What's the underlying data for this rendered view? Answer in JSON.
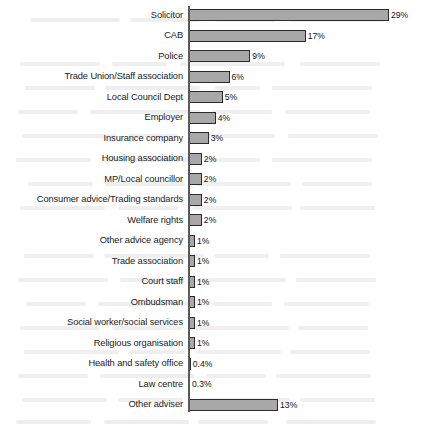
{
  "chart_data": {
    "type": "bar",
    "orientation": "horizontal",
    "title": "",
    "subtitle": "",
    "xlabel": "",
    "ylabel": "",
    "xlim": [
      0,
      30
    ],
    "grid": false,
    "legend": null,
    "value_suffix": "%",
    "categories": [
      "Solicitor",
      "CAB",
      "Police",
      "Trade Union/Staff association",
      "Local Council Dept",
      "Employer",
      "Insurance company",
      "Housing association",
      "MP/Local councillor",
      "Consumer advice/Trading standards",
      "Welfare rights",
      "Other advice agency",
      "Trade association",
      "Court staff",
      "Ombudsman",
      "Social worker/social services",
      "Religious organisation",
      "Health and safety office",
      "Law centre",
      "Other adviser"
    ],
    "values": [
      29,
      17,
      9,
      6,
      5,
      4,
      3,
      2,
      2,
      2,
      2,
      1,
      1,
      1,
      1,
      1,
      1,
      0.4,
      0.3,
      13
    ],
    "value_labels": [
      "29%",
      "17%",
      "9%",
      "6%",
      "5%",
      "4%",
      "3%",
      "2%",
      "2%",
      "2%",
      "2%",
      "1%",
      "1%",
      "1%",
      "1%",
      "1%",
      "1%",
      "0.4%",
      "0.3%",
      "13%"
    ],
    "colors": {
      "bar_fill": "#a8a8a8",
      "bar_border": "#2b2b2b",
      "axis": "#5a5a5a",
      "text": "#1a1a1a",
      "background": "#ffffff"
    }
  }
}
